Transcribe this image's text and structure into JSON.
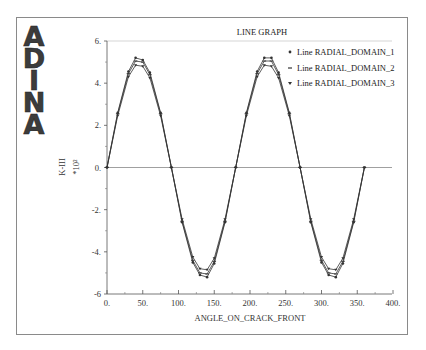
{
  "logo": {
    "letters": [
      "A",
      "D",
      "I",
      "N",
      "A"
    ]
  },
  "chart_data": {
    "type": "line",
    "title": "LINE GRAPH",
    "xlabel": "ANGLE_ON_CRACK_FRONT",
    "ylabel": "K-III",
    "yscale_label": "*10²",
    "xlim": [
      0,
      400
    ],
    "ylim": [
      -6,
      6
    ],
    "x_ticks": [
      "0.",
      "50.",
      "100.",
      "150.",
      "200.",
      "250.",
      "300.",
      "350.",
      "400."
    ],
    "y_ticks": [
      "6.",
      "4.",
      "2.",
      "0.",
      "-2.",
      "-4.",
      "-6"
    ],
    "grid": false,
    "legend_position": "upper right",
    "x": [
      0,
      15,
      30,
      40,
      50,
      60,
      75,
      90,
      105,
      120,
      130,
      140,
      150,
      165,
      180,
      195,
      210,
      220,
      230,
      240,
      255,
      270,
      285,
      300,
      310,
      320,
      330,
      345,
      360
    ],
    "series": [
      {
        "name": "Line RADIAL_DOMAIN_1",
        "marker": "circle",
        "values": [
          0,
          2.6,
          4.55,
          5.2,
          5.1,
          4.5,
          2.6,
          0,
          -2.6,
          -4.5,
          -5.1,
          -5.2,
          -4.55,
          -2.6,
          0,
          2.6,
          4.55,
          5.2,
          5.2,
          4.5,
          2.6,
          0,
          -2.6,
          -4.5,
          -5.1,
          -5.2,
          -4.55,
          -2.6,
          0
        ]
      },
      {
        "name": "Line RADIAL_DOMAIN_2",
        "marker": "dash",
        "values": [
          0,
          2.55,
          4.45,
          5.05,
          5.0,
          4.4,
          2.55,
          0,
          -2.55,
          -4.4,
          -5.0,
          -5.05,
          -4.45,
          -2.55,
          0,
          2.55,
          4.45,
          5.05,
          5.05,
          4.4,
          2.55,
          0,
          -2.55,
          -4.4,
          -5.0,
          -5.05,
          -4.45,
          -2.55,
          0
        ]
      },
      {
        "name": "Line RADIAL_DOMAIN_3",
        "marker": "triangle",
        "values": [
          0,
          2.45,
          4.3,
          4.85,
          4.8,
          4.25,
          2.45,
          0,
          -2.45,
          -4.25,
          -4.8,
          -4.85,
          -4.3,
          -2.45,
          0,
          2.45,
          4.3,
          4.85,
          4.8,
          4.25,
          2.45,
          0,
          -2.45,
          -4.25,
          -4.8,
          -4.85,
          -4.3,
          -2.45,
          0
        ]
      }
    ]
  }
}
